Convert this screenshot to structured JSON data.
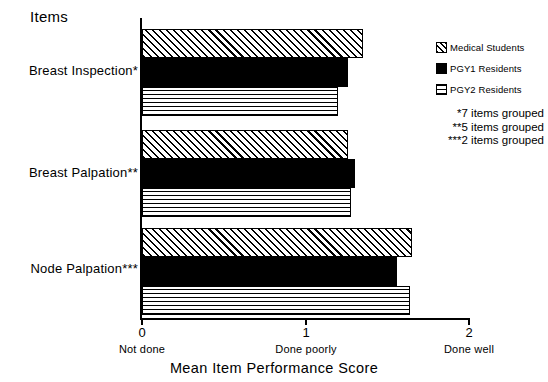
{
  "chart_data": {
    "type": "bar",
    "orientation": "horizontal",
    "title": "Mean Item Performance Score",
    "xlabel": "Mean Item Performance Score",
    "ylabel": "Items",
    "xlim": [
      0,
      2
    ],
    "grid": false,
    "legend_position": "top-right",
    "categories": [
      "Breast Inspection*",
      "Breast Palpation**",
      "Node Palpation***"
    ],
    "series": [
      {
        "name": "Medical Students",
        "pattern": "diagonal-hatch",
        "values": [
          1.35,
          1.26,
          1.65
        ]
      },
      {
        "name": "PGY1 Residents",
        "pattern": "solid-black",
        "values": [
          1.26,
          1.3,
          1.56
        ]
      },
      {
        "name": "PGY2 Residents",
        "pattern": "crosshatch-grid",
        "values": [
          1.2,
          1.28,
          1.64
        ]
      }
    ],
    "xticks": [
      {
        "value": 0,
        "label": "0",
        "sublabel": "Not done"
      },
      {
        "value": 1,
        "label": "1",
        "sublabel": "Done poorly"
      },
      {
        "value": 2,
        "label": "2",
        "sublabel": "Done well"
      }
    ],
    "annotations": [
      "*7 items grouped",
      "**5 items grouped",
      "***2 items grouped"
    ]
  },
  "axis": {
    "y_title": "Items",
    "x_title": "Mean Item Performance Score"
  },
  "ticks": {
    "t0_num": "0",
    "t0_sub": "Not done",
    "t1_num": "1",
    "t1_sub": "Done poorly",
    "t2_num": "2",
    "t2_sub": "Done well"
  },
  "rows": [
    {
      "label": "Breast Inspection*"
    },
    {
      "label": "Breast Palpation**"
    },
    {
      "label": "Node Palpation***"
    }
  ],
  "legend": {
    "items": [
      {
        "label": "Medical Students"
      },
      {
        "label": "PGY1 Residents"
      },
      {
        "label": "PGY2 Residents"
      }
    ]
  },
  "notes": {
    "lines": [
      "*7 items grouped",
      "**5 items grouped",
      "***2 items grouped"
    ]
  },
  "colors": {
    "ink": "#000000",
    "paper": "#ffffff"
  }
}
